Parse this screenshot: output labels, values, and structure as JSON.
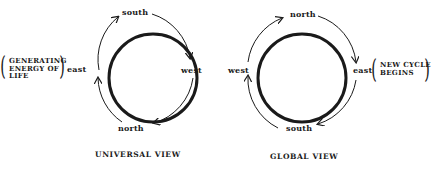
{
  "diagrams": [
    {
      "caption": "Universal View",
      "labels": {
        "top": "south",
        "right": "west",
        "bottom": "north",
        "left": "east"
      },
      "note": {
        "lines": [
          "Generating",
          "energy of",
          "life"
        ],
        "attached_to": "east",
        "side": "left"
      },
      "flow_direction": "clockwise"
    },
    {
      "caption": "Global View",
      "labels": {
        "top": "north",
        "right": "east",
        "bottom": "south",
        "left": "west"
      },
      "note": {
        "lines": [
          "new cycle",
          "begins"
        ],
        "attached_to": "east",
        "side": "right"
      },
      "flow_direction": "clockwise"
    }
  ],
  "colors": {
    "ink": "#1a1a1a",
    "background": "#ffffff"
  }
}
